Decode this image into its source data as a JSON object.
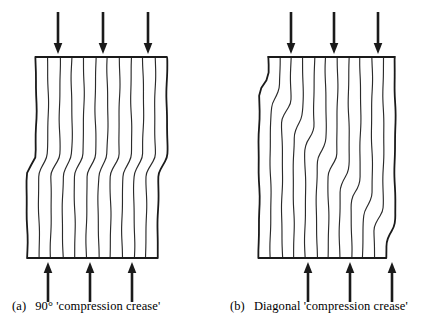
{
  "figure": {
    "background_color": "#ffffff",
    "ink_color": "#1a1a1a",
    "line_color": "#2b2b2b",
    "panels": [
      {
        "id": "panel-a",
        "tag": "(a)",
        "caption": "90° 'compression crease'",
        "crease_type": "horizontal",
        "crease_angle_degrees": 90,
        "body": {
          "left": 36,
          "right": 167,
          "top": 57,
          "bottom": 258,
          "jog_offset": 9,
          "jog_center_y": 165,
          "jog_height": 20,
          "stripe_count": 12
        },
        "arrows_top": {
          "label": "compression-arrow-down",
          "direction": "down",
          "count": 3,
          "x_positions": [
            58,
            103,
            148
          ],
          "y_start": 12,
          "y_end": 54
        },
        "arrows_bottom": {
          "label": "compression-arrow-up",
          "direction": "up",
          "count": 3,
          "x_positions": [
            48,
            90,
            132
          ],
          "y_start": 302,
          "y_end": 262
        }
      },
      {
        "id": "panel-b",
        "tag": "(b)",
        "caption": "Diagonal 'compression crease'",
        "crease_type": "diagonal",
        "body": {
          "left": 268,
          "right": 395,
          "top": 57,
          "bottom": 258,
          "jog_offset": 9,
          "jog_height": 20,
          "jog_y_right": 84,
          "jog_y_left": 232,
          "stripe_count": 12
        },
        "arrows_top": {
          "label": "compression-arrow-down",
          "direction": "down",
          "count": 3,
          "x_positions": [
            291,
            334,
            378
          ],
          "y_start": 12,
          "y_end": 54
        },
        "arrows_bottom": {
          "label": "compression-arrow-up",
          "direction": "up",
          "count": 3,
          "x_positions": [
            308,
            350,
            392
          ],
          "y_start": 302,
          "y_end": 262
        }
      }
    ]
  }
}
